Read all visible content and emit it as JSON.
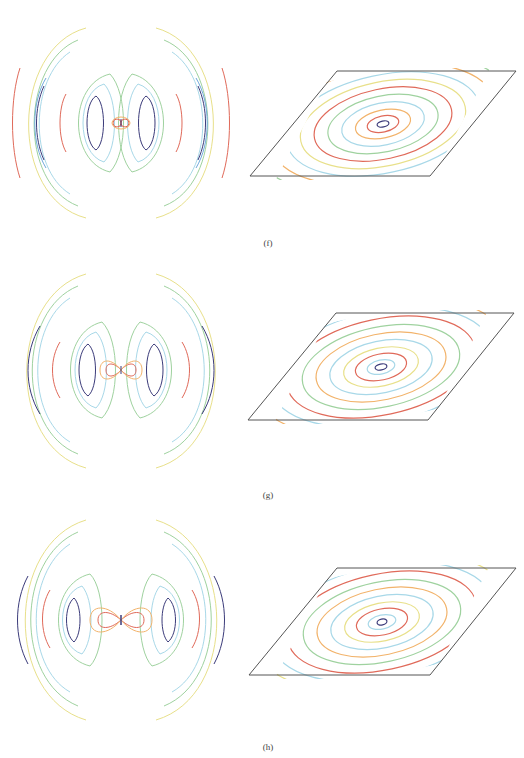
{
  "figure": {
    "rows": [
      {
        "label": "(f)",
        "left_plot": {
          "type": "contour",
          "description": "radiation pattern contours, symmetric lobes",
          "center_feature": "small double loop",
          "lobe_rings": 3
        },
        "right_plot": {
          "type": "contour",
          "description": "concentric ellipses inside parallelogram",
          "rings": 9
        }
      },
      {
        "label": "(g)",
        "left_plot": {
          "type": "contour",
          "description": "radiation pattern contours, symmetric lobes",
          "center_feature": "medium figure-eight",
          "lobe_rings": 3
        },
        "right_plot": {
          "type": "contour",
          "description": "concentric ellipses inside parallelogram",
          "rings": 9
        }
      },
      {
        "label": "(h)",
        "left_plot": {
          "type": "contour",
          "description": "radiation pattern contours, symmetric lobes",
          "center_feature": "wide figure-eight",
          "lobe_rings": 3
        },
        "right_plot": {
          "type": "contour",
          "description": "concentric ellipses inside parallelogram",
          "rings": 9
        }
      }
    ],
    "contour_colors": [
      "#3b3b7a",
      "#6fa8dc",
      "#a8d8e8",
      "#9fd29f",
      "#e8e08a",
      "#f2b36b",
      "#e06a5a"
    ]
  }
}
